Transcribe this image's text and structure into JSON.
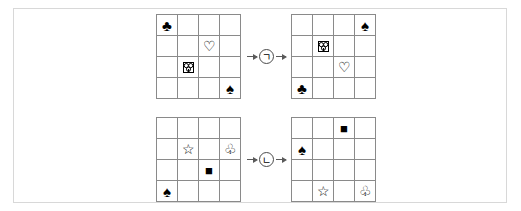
{
  "page": {
    "frame_color": "#d8d8d8",
    "grid_line_color": "#8a8a8a",
    "arrow_color": "#5a5a5a",
    "glyph_color": "#000000"
  },
  "glyph_map": {
    "spade-filled": "♠",
    "club-filled": "♣",
    "heart-open": "♡",
    "club-open": "♧",
    "star-open": "☆",
    "square-filled": "■",
    "odd-glyph": ""
  },
  "rules": [
    {
      "id": "rule-giyeok",
      "badge_label": "ㄱ",
      "arrow_left": "→",
      "arrow_right": "→",
      "input_grid": {
        "name": "grid-giyeok-input",
        "rows": 4,
        "cols": 4,
        "cells": [
          [
            "club-filled",
            "",
            "",
            ""
          ],
          [
            "",
            "",
            "heart-open",
            ""
          ],
          [
            "",
            "odd-glyph",
            "",
            ""
          ],
          [
            "",
            "",
            "",
            "spade-filled"
          ]
        ]
      },
      "output_grid": {
        "name": "grid-giyeok-output",
        "rows": 4,
        "cols": 4,
        "cells": [
          [
            "",
            "",
            "",
            "spade-filled"
          ],
          [
            "",
            "odd-glyph",
            "",
            ""
          ],
          [
            "",
            "",
            "heart-open",
            ""
          ],
          [
            "club-filled",
            "",
            "",
            ""
          ]
        ]
      }
    },
    {
      "id": "rule-nieun",
      "badge_label": "ㄴ",
      "arrow_left": "→",
      "arrow_right": "→",
      "input_grid": {
        "name": "grid-nieun-input",
        "rows": 4,
        "cols": 4,
        "cells": [
          [
            "",
            "",
            "",
            ""
          ],
          [
            "",
            "star-open",
            "",
            "club-open"
          ],
          [
            "",
            "",
            "square-filled",
            ""
          ],
          [
            "spade-filled",
            "",
            "",
            ""
          ]
        ]
      },
      "output_grid": {
        "name": "grid-nieun-output",
        "rows": 4,
        "cols": 4,
        "cells": [
          [
            "",
            "",
            "square-filled",
            ""
          ],
          [
            "spade-filled",
            "",
            "",
            ""
          ],
          [
            "",
            "",
            "",
            ""
          ],
          [
            "",
            "star-open",
            "",
            "club-open"
          ]
        ]
      }
    }
  ]
}
